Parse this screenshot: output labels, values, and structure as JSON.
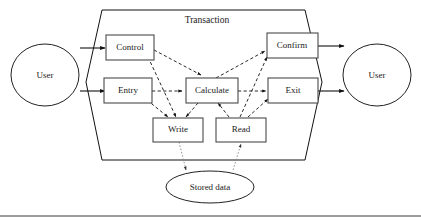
{
  "diagram": {
    "title": "Transaction",
    "actors": [
      {
        "id": "user-left",
        "label": "User"
      },
      {
        "id": "user-right",
        "label": "User"
      }
    ],
    "processes": [
      {
        "id": "control",
        "label": "Control"
      },
      {
        "id": "entry",
        "label": "Entry"
      },
      {
        "id": "calculate",
        "label": "Calculate"
      },
      {
        "id": "confirm",
        "label": "Confirm"
      },
      {
        "id": "exit",
        "label": "Exit"
      },
      {
        "id": "write",
        "label": "Write"
      },
      {
        "id": "read",
        "label": "Read"
      }
    ],
    "datastores": [
      {
        "id": "stored-data",
        "label": "Stored data"
      }
    ],
    "colors": {
      "stroke": "#111111",
      "box_stroke": "#4a4a4a",
      "datastore_stroke": "#8a8a8a",
      "background": "#ffffff",
      "text": "#1a1a1a"
    },
    "edges": [
      {
        "from": "user-left",
        "to": "control",
        "style": "solid"
      },
      {
        "from": "user-left",
        "to": "entry",
        "style": "solid"
      },
      {
        "from": "confirm",
        "to": "user-right",
        "style": "solid"
      },
      {
        "from": "exit",
        "to": "user-right",
        "style": "solid"
      },
      {
        "from": "control",
        "to": "calculate",
        "style": "dashed"
      },
      {
        "from": "control",
        "to": "write",
        "style": "dashed"
      },
      {
        "from": "entry",
        "to": "calculate",
        "style": "dashed"
      },
      {
        "from": "entry",
        "to": "write",
        "style": "dashed"
      },
      {
        "from": "calculate",
        "to": "write",
        "style": "dashed"
      },
      {
        "from": "calculate",
        "to": "confirm",
        "style": "dashed"
      },
      {
        "from": "calculate",
        "to": "exit",
        "style": "dashed"
      },
      {
        "from": "read",
        "to": "calculate",
        "style": "dashed"
      },
      {
        "from": "read",
        "to": "confirm",
        "style": "dashed"
      },
      {
        "from": "read",
        "to": "exit",
        "style": "dashed"
      },
      {
        "from": "write",
        "to": "stored-data",
        "style": "dotted"
      },
      {
        "from": "stored-data",
        "to": "read",
        "style": "dotted"
      }
    ]
  }
}
